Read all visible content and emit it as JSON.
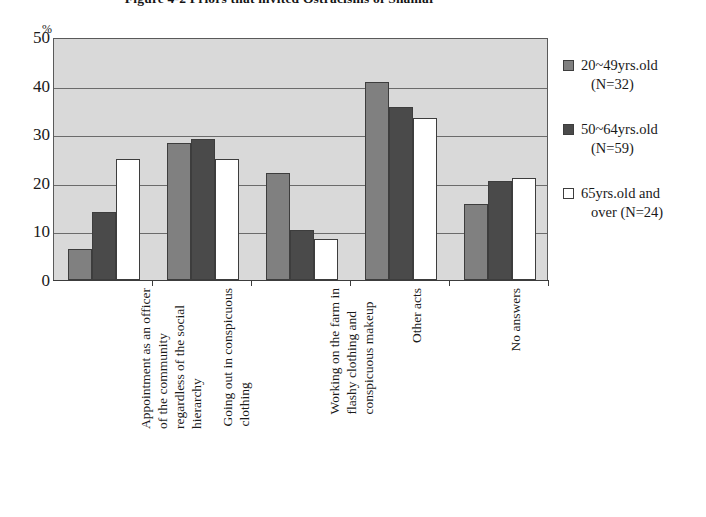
{
  "title": "Figure 4-2  Priors that invited Ostracisms of Shamar",
  "axis": {
    "y_unit": "%",
    "y_ticks": [
      "0",
      "10",
      "20",
      "30",
      "40",
      "50"
    ]
  },
  "legend": {
    "items": [
      {
        "swatch": "medium-gray",
        "line1": "20~49yrs.old",
        "line2": "(N=32)"
      },
      {
        "swatch": "dark-gray",
        "line1": "50~64yrs.old",
        "line2": "(N=59)"
      },
      {
        "swatch": "white",
        "line1": "65yrs.old and",
        "line2": "over (N=24)"
      }
    ]
  },
  "categories_wrapped": [
    [
      "Appointment as an officer",
      "of the community",
      "regardless of  the social",
      "hierarchy"
    ],
    [
      "Going out in conspicuous",
      "clothing"
    ],
    [
      "Working on the farm in",
      "flashy clothing and",
      "conspicuous makeup"
    ],
    [
      "Other acts"
    ],
    [
      "No answers"
    ]
  ],
  "chart_data": {
    "type": "bar",
    "title": "Figure 4-2  Priors that invited Ostracisms of Shamar",
    "xlabel": "",
    "ylabel": "%",
    "ylim": [
      0,
      50
    ],
    "yticks": [
      0,
      10,
      20,
      30,
      40,
      50
    ],
    "grid": true,
    "legend_position": "right",
    "categories": [
      "Appointment as an officer of the community regardless of the social hierarchy",
      "Going out in conspicuous clothing",
      "Working on the farm in flashy clothing and conspicuous makeup",
      "Other acts",
      "No answers"
    ],
    "series": [
      {
        "name": "20~49yrs.old (N=32)",
        "color": "#808080",
        "values": [
          6.4,
          28.2,
          22.0,
          40.8,
          15.7
        ]
      },
      {
        "name": "50~64yrs.old (N=59)",
        "color": "#4a4a4a",
        "values": [
          13.9,
          29.0,
          10.3,
          35.5,
          20.4
        ]
      },
      {
        "name": "65yrs.old and over (N=24)",
        "color": "#ffffff",
        "values": [
          25.0,
          25.0,
          8.5,
          33.3,
          20.9
        ]
      }
    ]
  }
}
